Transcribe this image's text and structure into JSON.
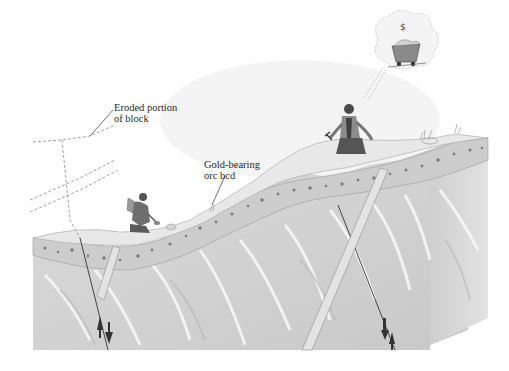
{
  "diagram": {
    "title": "",
    "labels": {
      "eroded": {
        "line1": "Eroded portion",
        "line2": "of block"
      },
      "ore_bed": {
        "line1": "Gold-bearing",
        "line2": "orc bcd"
      }
    },
    "elements": [
      "eroded-block-outline",
      "left-fault-line",
      "right-fault-line",
      "ore-bed-layer",
      "bedrock-block",
      "prospector-left",
      "prospector-right",
      "thought-bubble-mine-cart",
      "fault-motion-arrows"
    ],
    "colors": {
      "bedrock": "#d9d9d9",
      "bedrock_dark": "#bdbdbd",
      "surface": "#e6e6e6",
      "ore_bed": "#c9c9c9",
      "pebbles": "#7a7a7a",
      "lines": "#333333"
    }
  }
}
